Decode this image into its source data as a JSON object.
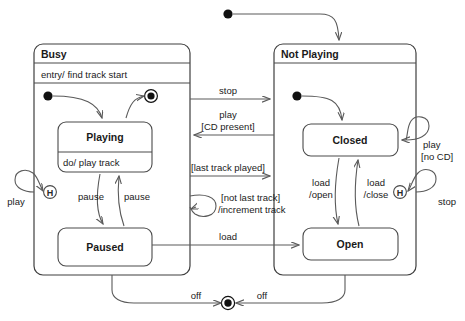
{
  "diagram": {
    "type": "uml-state-diagram",
    "colors": {
      "background": "#ffffff",
      "stroke": "#4a4a4a",
      "edge": "#5a5a5a",
      "text": "#1a1a1a"
    }
  },
  "composite_states": [
    {
      "id": "busy",
      "name": "Busy",
      "entry_action": "entry/ find track start",
      "x": 34,
      "y": 44,
      "w": 156,
      "h": 231
    },
    {
      "id": "not_playing",
      "name": "Not Playing",
      "entry_action": "",
      "x": 274,
      "y": 44,
      "w": 142,
      "h": 231
    }
  ],
  "states": [
    {
      "id": "playing",
      "name": "Playing",
      "activity": "do/ play track",
      "x": 58,
      "y": 122,
      "w": 94,
      "h": 50
    },
    {
      "id": "paused",
      "name": "Paused",
      "activity": "",
      "x": 58,
      "y": 228,
      "w": 94,
      "h": 38
    },
    {
      "id": "closed",
      "name": "Closed",
      "activity": "",
      "x": 303,
      "y": 124,
      "w": 95,
      "h": 32
    },
    {
      "id": "open",
      "name": "Open",
      "activity": "",
      "x": 303,
      "y": 228,
      "w": 95,
      "h": 32
    }
  ],
  "pseudostates": [
    {
      "id": "top-initial",
      "kind": "initial",
      "cx": 228,
      "cy": 14
    },
    {
      "id": "busy-initial",
      "kind": "initial",
      "cx": 48,
      "cy": 96
    },
    {
      "id": "busy-final",
      "kind": "final",
      "cx": 151,
      "cy": 96
    },
    {
      "id": "notplaying-initial",
      "kind": "initial",
      "cx": 297,
      "cy": 96
    },
    {
      "id": "busy-history",
      "kind": "history",
      "cx": 50,
      "cy": 192,
      "label": "H"
    },
    {
      "id": "notplaying-history",
      "kind": "history",
      "cx": 400,
      "cy": 192,
      "label": "H"
    },
    {
      "id": "bottom-final",
      "kind": "final",
      "cx": 228,
      "cy": 303
    }
  ],
  "transitions": [
    {
      "id": "t-stop",
      "label": "stop",
      "x": 228,
      "y": 93,
      "anchor": "middle",
      "lines": 1
    },
    {
      "id": "t-play-cd",
      "label": "play",
      "x": 228,
      "y": 116,
      "anchor": "middle",
      "lines": 2
    },
    {
      "id": "t-play-cd-guard",
      "label": "[CD present]",
      "x": 228,
      "y": 128,
      "anchor": "middle",
      "lines": 1
    },
    {
      "id": "t-last-track",
      "label": "[last track played]",
      "x": 228,
      "y": 165,
      "anchor": "middle",
      "lines": 1
    },
    {
      "id": "t-not-last",
      "label": "[not last track]",
      "x": 233,
      "y": 199,
      "anchor": "start",
      "lines": 2
    },
    {
      "id": "t-not-last-eff",
      "label": "/increment track",
      "x": 230,
      "y": 211,
      "anchor": "start",
      "lines": 1
    },
    {
      "id": "t-load",
      "label": "load",
      "x": 228,
      "y": 239,
      "anchor": "middle",
      "lines": 1
    },
    {
      "id": "t-pause-down",
      "label": "pause",
      "x": 91,
      "y": 200,
      "anchor": "middle",
      "lines": 1
    },
    {
      "id": "t-pause-up",
      "label": "pause",
      "x": 136,
      "y": 200,
      "anchor": "middle",
      "lines": 1
    },
    {
      "id": "t-play-hist",
      "label": "play",
      "x": 16,
      "y": 203,
      "anchor": "middle",
      "lines": 1
    },
    {
      "id": "t-stop-hist",
      "label": "stop",
      "x": 446,
      "y": 203,
      "anchor": "middle",
      "lines": 1
    },
    {
      "id": "t-play-nocd",
      "label": "play",
      "x": 423,
      "y": 148,
      "anchor": "start",
      "lines": 2
    },
    {
      "id": "t-play-nocd-guard",
      "label": "[no CD]",
      "x": 421,
      "y": 160,
      "anchor": "start",
      "lines": 1
    },
    {
      "id": "t-load-open",
      "label": "load",
      "x": 321,
      "y": 186,
      "anchor": "middle",
      "lines": 2
    },
    {
      "id": "t-load-open-eff",
      "label": "/open",
      "x": 321,
      "y": 198,
      "anchor": "middle",
      "lines": 1
    },
    {
      "id": "t-load-close",
      "label": "load",
      "x": 375,
      "y": 186,
      "anchor": "middle",
      "lines": 2
    },
    {
      "id": "t-load-close-eff",
      "label": "/close",
      "x": 375,
      "y": 198,
      "anchor": "middle",
      "lines": 1
    },
    {
      "id": "t-off-left",
      "label": "off",
      "x": 196,
      "y": 299,
      "anchor": "middle",
      "lines": 1
    },
    {
      "id": "t-off-right",
      "label": "off",
      "x": 262,
      "y": 299,
      "anchor": "middle",
      "lines": 1
    }
  ]
}
